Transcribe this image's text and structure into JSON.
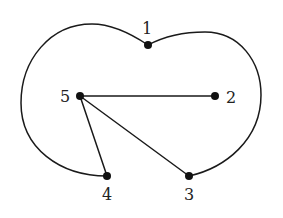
{
  "diagram": {
    "type": "graph",
    "directed": false,
    "colors": {
      "stroke": "#1a1a1a",
      "node": "#111111",
      "label": "#222222",
      "background": "#ffffff"
    },
    "nodes": [
      {
        "id": "1",
        "label": "1"
      },
      {
        "id": "2",
        "label": "2"
      },
      {
        "id": "3",
        "label": "3"
      },
      {
        "id": "4",
        "label": "4"
      },
      {
        "id": "5",
        "label": "5"
      }
    ],
    "edges": [
      {
        "from": "5",
        "to": "2",
        "style": "straight"
      },
      {
        "from": "5",
        "to": "3",
        "style": "straight"
      },
      {
        "from": "5",
        "to": "4",
        "style": "straight"
      },
      {
        "from": "1",
        "to": "4",
        "style": "curved-outer-left"
      },
      {
        "from": "1",
        "to": "3",
        "style": "curved-outer-right"
      }
    ]
  }
}
